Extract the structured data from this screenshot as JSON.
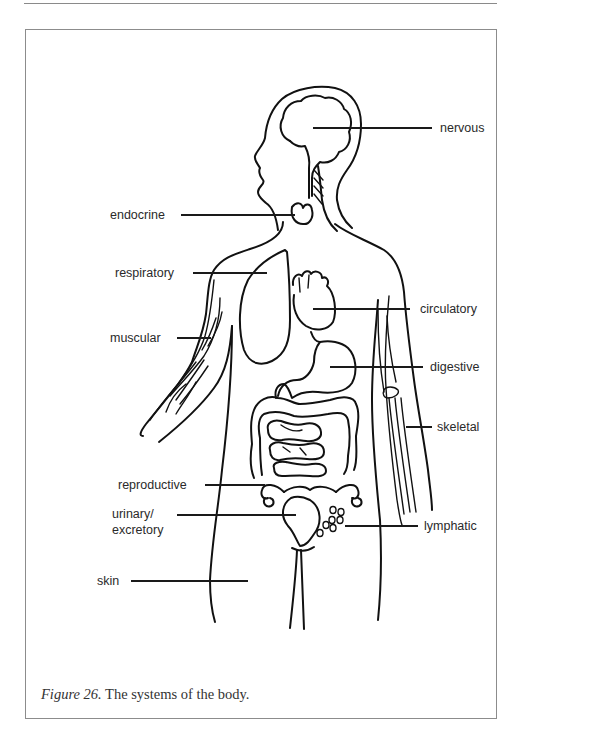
{
  "figure": {
    "caption_number": "Figure 26.",
    "caption_text": " The systems of the body."
  },
  "labels": {
    "nervous": "nervous",
    "endocrine": "endocrine",
    "respiratory": "respiratory",
    "circulatory": "circulatory",
    "muscular": "muscular",
    "digestive": "digestive",
    "skeletal": "skeletal",
    "reproductive": "reproductive",
    "urinary_line1": "urinary/",
    "urinary_line2": "excretory",
    "lymphatic": "lymphatic",
    "skin": "skin"
  },
  "colors": {
    "line": "#111111",
    "text": "#2a2a2a",
    "frame": "#8c8c8c"
  }
}
